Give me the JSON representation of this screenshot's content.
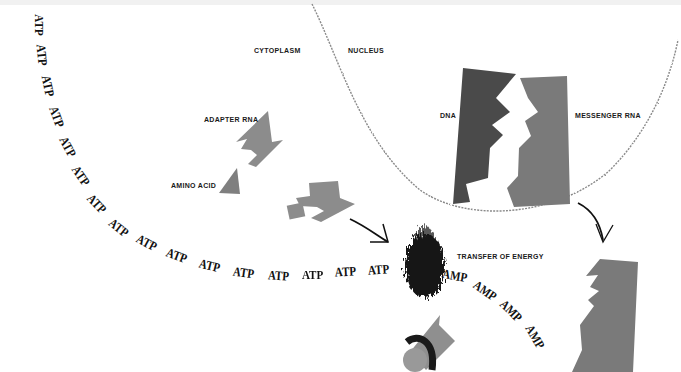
{
  "labels": {
    "cytoplasm": "CYTOPLASM",
    "nucleus": "NUCLEUS",
    "dna": "DNA",
    "messenger_rna": "MESSENGER RNA",
    "adapter_rna": "ADAPTER RNA",
    "amino_acid": "AMINO ACID",
    "transfer_of_energy": "TRANSFER OF ENERGY"
  },
  "atp_chain": [
    {
      "text": "ATP",
      "x": 38,
      "y": 25,
      "rot": 90
    },
    {
      "text": "ATP",
      "x": 41,
      "y": 55,
      "rot": 85
    },
    {
      "text": "ATP",
      "x": 47,
      "y": 86,
      "rot": 78
    },
    {
      "text": "ATP",
      "x": 56,
      "y": 117,
      "rot": 70
    },
    {
      "text": "ATP",
      "x": 67,
      "y": 147,
      "rot": 62
    },
    {
      "text": "ATP",
      "x": 80,
      "y": 176,
      "rot": 55
    },
    {
      "text": "ATP",
      "x": 96,
      "y": 204,
      "rot": 47
    },
    {
      "text": "ATP",
      "x": 118,
      "y": 228,
      "rot": 38
    },
    {
      "text": "ATP",
      "x": 146,
      "y": 243,
      "rot": 28
    },
    {
      "text": "ATP",
      "x": 176,
      "y": 256,
      "rot": 20
    },
    {
      "text": "ATP",
      "x": 209,
      "y": 266,
      "rot": 14
    },
    {
      "text": "ATP",
      "x": 243,
      "y": 273,
      "rot": 8
    },
    {
      "text": "ATP",
      "x": 278,
      "y": 276,
      "rot": 4
    },
    {
      "text": "ATP",
      "x": 312,
      "y": 275,
      "rot": 0
    },
    {
      "text": "ATP",
      "x": 345,
      "y": 272,
      "rot": -3
    },
    {
      "text": "ATP",
      "x": 378,
      "y": 270,
      "rot": -4
    }
  ],
  "amp_chain": [
    {
      "text": "AMP",
      "x": 452,
      "y": 276,
      "rot": 10
    },
    {
      "text": "AMP",
      "x": 482,
      "y": 291,
      "rot": 35
    },
    {
      "text": "AMP",
      "x": 508,
      "y": 311,
      "rot": 45
    },
    {
      "text": "AMP",
      "x": 532,
      "y": 337,
      "rot": 60
    }
  ],
  "colors": {
    "dna": "#4a4a4a",
    "messenger_rna": "#7a7a7a",
    "adapter_rna": "#8c8c8c",
    "amino_acid": "#7f7f7f",
    "energy_burst": "#151515",
    "membrane": "#8a8a8a",
    "arrows": "#111111"
  }
}
